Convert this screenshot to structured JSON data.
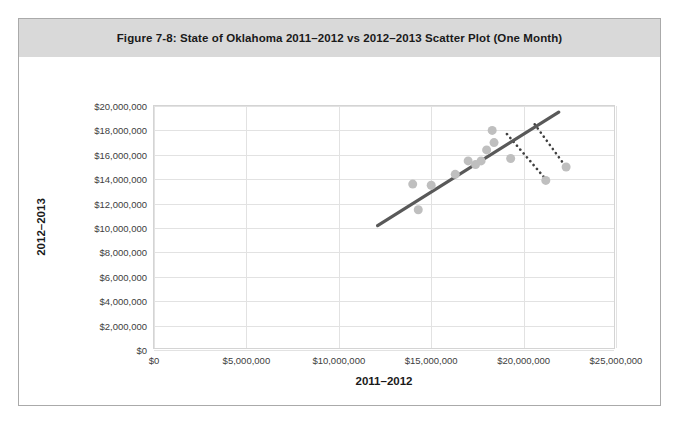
{
  "figure": {
    "caption": "Figure 7-8: State of Oklahoma 2011–2012 vs 2012–2013 Scatter Plot (One Month)",
    "frame_border_color": "#aaaaaa",
    "caption_bar_color": "#d9d9d9"
  },
  "chart_data": {
    "type": "scatter",
    "title": "Figure 7-8: State of Oklahoma 2011–2012 vs 2012–2013 Scatter Plot (One Month)",
    "xlabel": "2011–2012",
    "ylabel": "2012–2013",
    "xlim": [
      0,
      25000000
    ],
    "ylim": [
      0,
      20000000
    ],
    "xticks": [
      0,
      5000000,
      10000000,
      15000000,
      20000000,
      25000000
    ],
    "yticks": [
      0,
      2000000,
      4000000,
      6000000,
      8000000,
      10000000,
      12000000,
      14000000,
      16000000,
      18000000,
      20000000
    ],
    "xtick_labels": [
      "$0",
      "$5,000,000",
      "$10,000,000",
      "$15,000,000",
      "$20,000,000",
      "$25,000,000"
    ],
    "ytick_labels": [
      "$0",
      "$2,000,000",
      "$4,000,000",
      "$6,000,000",
      "$8,000,000",
      "$10,000,000",
      "$12,000,000",
      "$14,000,000",
      "$16,000,000",
      "$18,000,000",
      "$20,000,000"
    ],
    "grid": true,
    "grid_axes": "both",
    "legend": false,
    "marker_color": "#bfbfbf",
    "marker_size": 9,
    "points": [
      {
        "x": 14000000,
        "y": 13600000
      },
      {
        "x": 14300000,
        "y": 11500000
      },
      {
        "x": 15000000,
        "y": 13500000
      },
      {
        "x": 16300000,
        "y": 14400000
      },
      {
        "x": 17000000,
        "y": 15500000
      },
      {
        "x": 17400000,
        "y": 15200000
      },
      {
        "x": 17700000,
        "y": 15500000
      },
      {
        "x": 18000000,
        "y": 16400000
      },
      {
        "x": 18300000,
        "y": 18000000
      },
      {
        "x": 18400000,
        "y": 17000000
      },
      {
        "x": 19300000,
        "y": 15700000
      },
      {
        "x": 21200000,
        "y": 13900000
      },
      {
        "x": 22300000,
        "y": 15000000
      }
    ],
    "trendline": {
      "type": "linear",
      "color": "#595959",
      "x_start": 12100000,
      "y_start": 10200000,
      "x_end": 21900000,
      "y_end": 19500000
    },
    "annotations": [
      {
        "type": "dotted-pointer",
        "color": "#404040",
        "from_x": 19100000,
        "from_y": 17700000,
        "to_x": 21200000,
        "to_y": 14000000,
        "target_point": {
          "x": 21200000,
          "y": 13900000
        }
      },
      {
        "type": "dotted-pointer",
        "color": "#404040",
        "from_x": 20600000,
        "from_y": 18500000,
        "to_x": 22200000,
        "to_y": 15200000,
        "target_point": {
          "x": 22300000,
          "y": 15000000
        }
      }
    ]
  }
}
